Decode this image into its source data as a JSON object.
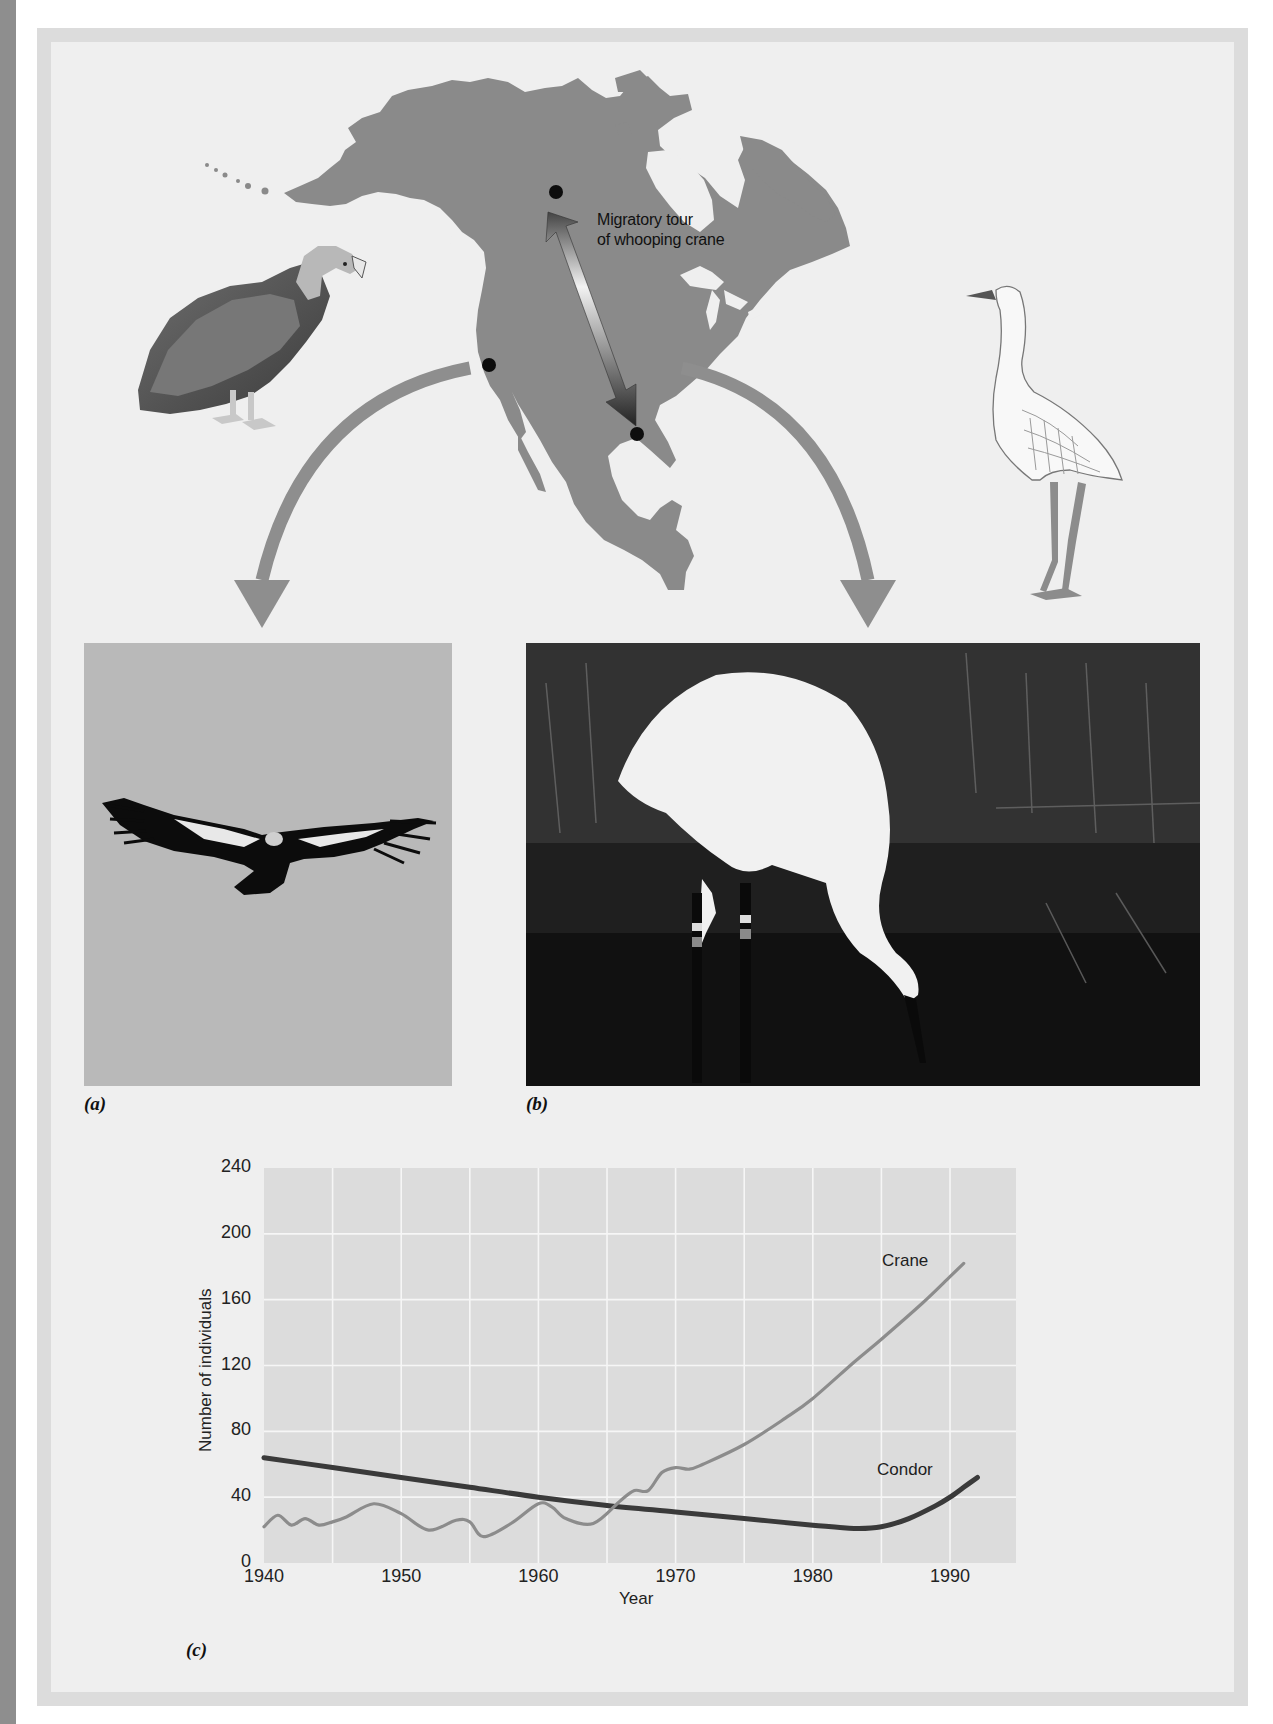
{
  "figure": {
    "map": {
      "caption_line1": "Migratory tour",
      "caption_line2": "of whooping crane",
      "land_color": "#8a8a8a",
      "water_color": "#efefef",
      "locations": [
        {
          "name": "wood-buffalo-breeding-site",
          "x": 556,
          "y": 192
        },
        {
          "name": "california-condor-site",
          "x": 489,
          "y": 365
        },
        {
          "name": "aransas-wintering-site",
          "x": 637,
          "y": 434
        }
      ]
    },
    "panels": {
      "a_label": "(a)",
      "b_label": "(b)",
      "c_label": "(c)"
    },
    "illustrations": {
      "condor_drawing": "California condor illustration",
      "crane_drawing": "Whooping crane illustration",
      "photo_a": "California condor in flight",
      "photo_b": "Whooping crane feeding in marsh"
    }
  },
  "chart_data": {
    "type": "line",
    "title": "",
    "xlabel": "Year",
    "ylabel": "Number of individuals",
    "xlim": [
      1940,
      1995
    ],
    "ylim": [
      0,
      240
    ],
    "x_ticks": [
      "1940",
      "1950",
      "1960",
      "1970",
      "1980",
      "1990"
    ],
    "y_ticks": [
      "0",
      "40",
      "80",
      "120",
      "160",
      "200",
      "240"
    ],
    "grid": true,
    "legend": "inline labels",
    "series": [
      {
        "name": "Crane",
        "color": "#8c8c8c",
        "x": [
          1940,
          1941,
          1942,
          1943,
          1944,
          1945,
          1946,
          1948,
          1950,
          1952,
          1954,
          1955,
          1956,
          1958,
          1960,
          1961,
          1962,
          1964,
          1966,
          1967,
          1968,
          1969,
          1970,
          1971,
          1972,
          1975,
          1978,
          1980,
          1983,
          1985,
          1988,
          1990,
          1991
        ],
        "values": [
          22,
          29,
          23,
          27,
          23,
          25,
          28,
          36,
          30,
          20,
          26,
          25,
          16,
          24,
          36,
          34,
          27,
          24,
          38,
          44,
          44,
          55,
          58,
          57,
          60,
          72,
          88,
          100,
          122,
          136,
          158,
          174,
          182
        ]
      },
      {
        "name": "Condor",
        "color": "#3a3a3a",
        "x": [
          1940,
          1945,
          1950,
          1955,
          1960,
          1965,
          1970,
          1975,
          1980,
          1983,
          1985,
          1987,
          1989,
          1990,
          1991,
          1992
        ],
        "values": [
          64,
          58,
          52,
          46,
          40,
          35,
          31,
          27,
          23,
          21,
          22,
          27,
          35,
          40,
          46,
          52
        ]
      }
    ]
  }
}
